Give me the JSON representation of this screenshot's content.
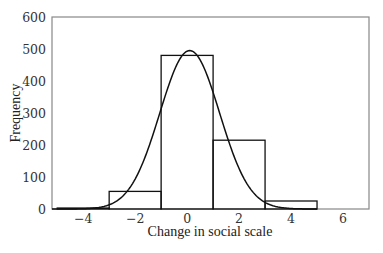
{
  "chart_data": {
    "type": "bar",
    "subtype": "histogram_with_normal_curve",
    "title": "",
    "xlabel": "Change in social scale",
    "ylabel": "Frequency",
    "xlim": [
      -5.2,
      7.0
    ],
    "ylim": [
      0,
      600
    ],
    "x_ticks": [
      -4,
      -2,
      0,
      2,
      4,
      6
    ],
    "x_tick_labels": [
      "−4",
      "−2",
      "0",
      "2",
      "4",
      "6"
    ],
    "y_ticks": [
      0,
      100,
      200,
      300,
      400,
      500,
      600
    ],
    "y_tick_labels": [
      "0",
      "100",
      "200",
      "300",
      "400",
      "500",
      "600"
    ],
    "grid": false,
    "legend": null,
    "bins": [
      {
        "from": -5,
        "to": -3,
        "value": 3
      },
      {
        "from": -3,
        "to": -1,
        "value": 55
      },
      {
        "from": -1,
        "to": 1,
        "value": 480
      },
      {
        "from": 1,
        "to": 3,
        "value": 215
      },
      {
        "from": 3,
        "to": 5,
        "value": 25
      }
    ],
    "categories": [
      "-5 to -3",
      "-3 to -1",
      "-1 to 1",
      "1 to 3",
      "3 to 5"
    ],
    "values": [
      3,
      55,
      480,
      215,
      25
    ],
    "overlay_curve": {
      "type": "normal",
      "mean": 0.1,
      "sd": 1.15,
      "peak": 495
    }
  },
  "colors": {
    "frame": "#888888",
    "bars": "#111111",
    "curve": "#111111"
  }
}
